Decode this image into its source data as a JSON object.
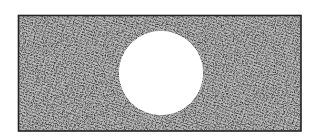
{
  "figure": {
    "plate": {
      "x": 18,
      "y": 15,
      "width": 283,
      "height": 116,
      "border_color": "#222222",
      "fill_color": "#8a8a8a"
    },
    "hole": {
      "cx": 161,
      "cy": 73,
      "r": 42,
      "fill_color": "#ffffff"
    }
  }
}
